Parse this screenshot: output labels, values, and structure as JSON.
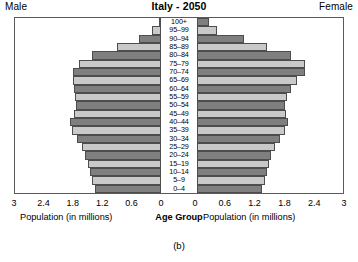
{
  "header": {
    "title": "Italy - 2050",
    "male_label": "Male",
    "female_label": "Female"
  },
  "axis": {
    "left_caption": "Population (in millions)",
    "center_caption": "Age Group",
    "right_caption": "Population (in millions)",
    "left_ticks": [
      "3",
      "2.4",
      "1.8",
      "1.2",
      "0.6",
      "0"
    ],
    "right_ticks": [
      "0",
      "0.6",
      "1.2",
      "1.8",
      "2.4",
      "3"
    ]
  },
  "figure_caption": "(b)",
  "colors": {
    "bar_dark": "#7f7f7f",
    "bar_light": "#c9c9c9",
    "bar_border": "#4d4d4d",
    "frame": "#5a5a5a"
  },
  "chart_data": {
    "type": "bar",
    "subtype": "population-pyramid",
    "title": "Italy - 2050",
    "xlabel": "Population (in millions)",
    "ylabel": "Age Group",
    "xlim": [
      0,
      3
    ],
    "xticks": [
      0,
      0.6,
      1.2,
      1.8,
      2.4,
      3
    ],
    "grid": false,
    "legend": [
      "Male",
      "Female"
    ],
    "legend_position": "top-left and top-right",
    "categories": [
      "100+",
      "95–99",
      "90–94",
      "85–89",
      "80–84",
      "75–79",
      "70–74",
      "65–69",
      "60–64",
      "55–59",
      "50–54",
      "45–49",
      "40–44",
      "35–39",
      "30–34",
      "25–29",
      "20–24",
      "15–19",
      "10–14",
      "5–9",
      "0–4"
    ],
    "series": [
      {
        "name": "Male",
        "side": "left",
        "values": [
          0.05,
          0.19,
          0.45,
          0.9,
          1.42,
          1.69,
          1.81,
          1.81,
          1.79,
          1.76,
          1.74,
          1.79,
          1.87,
          1.83,
          1.73,
          1.63,
          1.56,
          1.5,
          1.45,
          1.41,
          1.36
        ]
      },
      {
        "name": "Female",
        "side": "right",
        "values": [
          0.24,
          0.42,
          0.97,
          1.43,
          1.93,
          2.21,
          2.21,
          2.06,
          1.93,
          1.85,
          1.81,
          1.83,
          1.87,
          1.81,
          1.71,
          1.61,
          1.53,
          1.47,
          1.43,
          1.39,
          1.33
        ]
      }
    ]
  }
}
